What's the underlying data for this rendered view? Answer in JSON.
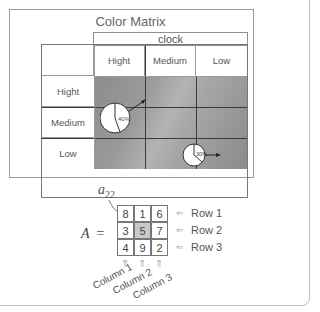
{
  "color_matrix": {
    "title": "Color Matrix",
    "column_group_label": "clock",
    "column_headers": [
      "Hight",
      "Medium",
      "Low"
    ],
    "row_headers": [
      "Hight",
      "Medium",
      "Low"
    ],
    "colors": {
      "heatmap_dark": "#8c8c8c",
      "heatmap_light": "#b3b3b3",
      "grid_line": "#3a3a3a",
      "border": "#9a9a9a"
    },
    "markers": [
      {
        "label": "40%",
        "row": "Hight/Medium",
        "column": "Hight",
        "arrow_direction": "up-right"
      },
      {
        "label": "30%",
        "row": "Low",
        "column": "Medium/Low",
        "arrow_direction": "right"
      }
    ]
  },
  "matrix_example": {
    "symbol": "A",
    "equals": "=",
    "pointer_label": "a",
    "pointer_sub": "22",
    "values": [
      [
        8,
        1,
        6
      ],
      [
        3,
        5,
        7
      ],
      [
        4,
        9,
        2
      ]
    ],
    "highlighted": {
      "row": 2,
      "column": 2,
      "value": 5
    },
    "row_labels": [
      "Row 1",
      "Row 2",
      "Row 3"
    ],
    "column_labels": [
      "Column 1",
      "Column 2",
      "Column 3"
    ],
    "arrow_glyph_left": "⇐",
    "arrow_glyph_up": "⇑"
  }
}
